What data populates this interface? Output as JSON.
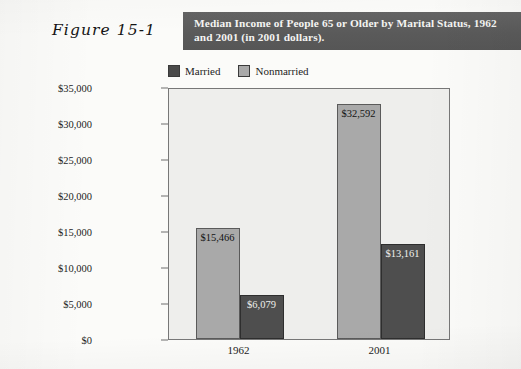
{
  "figure": {
    "label": "Figure 15-1",
    "title": "Median Income of People 65 or Older by Marital Status, 1962 and 2001 (in 2001 dollars)."
  },
  "colors": {
    "band": "#5d5d5d",
    "married": "#4e4e4e",
    "nonmarried": "#a9a9a9",
    "plot_background": "#eeeeec",
    "page_background": "#fbfbf9"
  },
  "legend": {
    "items": [
      {
        "label": "Married",
        "swatch": "married-swatch"
      },
      {
        "label": "Nonmarried",
        "swatch": "nonmarried-swatch"
      }
    ]
  },
  "chart_data": {
    "type": "bar",
    "title": "Median Income of People 65 or Older by Marital Status, 1962 and 2001 (in 2001 dollars).",
    "xlabel": "",
    "ylabel": "",
    "categories": [
      "1962",
      "2001"
    ],
    "series": [
      {
        "name": "Nonmarried",
        "values": [
          15466,
          32592
        ],
        "labels": [
          "$15,466",
          "$32,592"
        ],
        "color": "#a9a9a9"
      },
      {
        "name": "Married",
        "values": [
          6079,
          13161
        ],
        "labels": [
          "$6,079",
          "$13,161"
        ],
        "color": "#4e4e4e"
      }
    ],
    "ylim": [
      0,
      35000
    ],
    "ytick_values": [
      0,
      5000,
      10000,
      15000,
      20000,
      25000,
      30000,
      35000
    ],
    "ytick_labels": [
      "$0",
      "$5,000",
      "$10,000",
      "$15,000",
      "$20,000",
      "$25,000",
      "$30,000",
      "$35,000"
    ],
    "grid": false,
    "legend_position": "top-left"
  }
}
